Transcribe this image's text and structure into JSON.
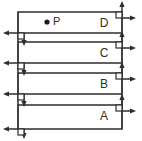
{
  "figure": {
    "type": "stacked-slab-force-diagram",
    "width": 142,
    "height": 141,
    "background_color": "#ffffff",
    "line_color": "#3a3a3a",
    "arrow_color": "#2e2e2e",
    "text_color": "#2e2e2e"
  },
  "point": {
    "label": "P",
    "dot_x": 47,
    "dot_y": 22,
    "label_x": 53,
    "label_y": 22,
    "marker": "filled-circle"
  },
  "slabs": [
    {
      "id": "slab-d",
      "label": "D",
      "label_x": 104,
      "label_y": 24,
      "top": 12,
      "bottom": 33,
      "left": 18,
      "right": 122
    },
    {
      "id": "slab-c",
      "label": "C",
      "label_x": 104,
      "label_y": 54,
      "top": 42,
      "bottom": 63,
      "left": 18,
      "right": 122
    },
    {
      "id": "slab-b",
      "label": "B",
      "label_x": 104,
      "label_y": 85,
      "top": 73,
      "bottom": 94,
      "left": 18,
      "right": 122
    },
    {
      "id": "slab-a",
      "label": "A",
      "label_x": 104,
      "label_y": 117,
      "top": 105,
      "bottom": 129,
      "left": 18,
      "right": 122
    }
  ],
  "dividers": [
    {
      "id": "divider-dc",
      "y": 33
    },
    {
      "id": "divider-cb",
      "y": 63
    },
    {
      "id": "divider-ba",
      "y": 94
    }
  ],
  "left_force_groups": [
    {
      "id": "left-group-1",
      "y": 33,
      "left_arrow": true,
      "down_arrow": true
    },
    {
      "id": "left-group-2",
      "y": 63,
      "left_arrow": true,
      "down_arrow": true
    },
    {
      "id": "left-group-3",
      "y": 94,
      "left_arrow": true,
      "down_arrow": true
    },
    {
      "id": "left-group-4",
      "y": 129,
      "left_arrow": true,
      "down_arrow": true
    }
  ],
  "right_force_groups": [
    {
      "id": "right-group-1",
      "y": 12,
      "up_arrow": true,
      "right_arrow": true
    },
    {
      "id": "right-group-2",
      "y": 42,
      "up_arrow": true,
      "right_arrow": true
    },
    {
      "id": "right-group-3",
      "y": 73,
      "up_arrow": true,
      "right_arrow": true
    },
    {
      "id": "right-group-4",
      "y": 105,
      "up_arrow": true,
      "right_arrow": true
    }
  ]
}
